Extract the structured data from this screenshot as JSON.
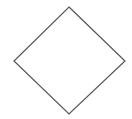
{
  "diagram": {
    "shapes": [
      {
        "type": "diamond",
        "label": "",
        "fill": "#ffffff",
        "stroke": "#555555",
        "vertices": {
          "top": [
            69,
            7
          ],
          "right": [
            125,
            61
          ],
          "bottom": [
            69,
            114
          ],
          "left": [
            14,
            61
          ]
        }
      }
    ]
  }
}
